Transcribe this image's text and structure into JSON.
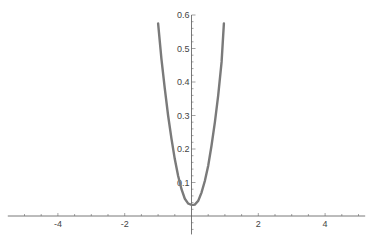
{
  "chart_data": {
    "type": "line",
    "title": "",
    "xlabel": "",
    "ylabel": "",
    "xlim": [
      -5.5,
      5.2
    ],
    "ylim": [
      -0.055,
      0.6
    ],
    "grid": false,
    "x_ticks": [
      -4,
      -2,
      2,
      4
    ],
    "x_tick_labels": [
      "-4",
      "-2",
      "2",
      "4"
    ],
    "y_ticks": [
      0.1,
      0.2,
      0.3,
      0.4,
      0.5,
      0.6
    ],
    "y_tick_labels": [
      "0.1",
      "0.2",
      "0.3",
      "0.4",
      "0.5",
      "0.6"
    ],
    "series": [
      {
        "name": "curve",
        "color": "#7a7a7a",
        "x": [
          -1.0,
          -0.9,
          -0.8,
          -0.7,
          -0.6,
          -0.5,
          -0.4,
          -0.3,
          -0.2,
          -0.1,
          0.0,
          0.05,
          0.1,
          0.2,
          0.3,
          0.4,
          0.5,
          0.6,
          0.7,
          0.8,
          0.9,
          0.97
        ],
        "y": [
          0.575,
          0.47,
          0.38,
          0.3,
          0.23,
          0.17,
          0.12,
          0.08,
          0.052,
          0.037,
          0.033,
          0.033,
          0.034,
          0.045,
          0.07,
          0.105,
          0.15,
          0.21,
          0.28,
          0.36,
          0.46,
          0.575
        ]
      }
    ]
  }
}
